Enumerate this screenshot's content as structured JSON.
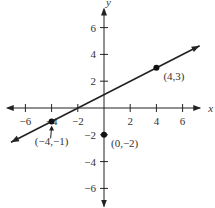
{
  "chart_data": {
    "type": "line",
    "title": "",
    "xlabel": "x",
    "ylabel": "y",
    "xlim": [
      -7.5,
      7.5
    ],
    "ylim": [
      -7.5,
      7.5
    ],
    "x_ticks": [
      -6,
      -4,
      -2,
      2,
      4,
      6
    ],
    "y_ticks": [
      -6,
      -4,
      -2,
      2,
      4,
      6
    ],
    "x_tick_labels": [
      "−6",
      "−4",
      "−2",
      "2",
      "4",
      "6"
    ],
    "y_tick_labels": [
      "−6",
      "−4",
      "−2",
      "2",
      "4",
      "6"
    ],
    "line": {
      "slope": 0.5,
      "intercept": 1,
      "x_range": [
        -7.5,
        7.5
      ]
    },
    "points": [
      {
        "x": 4,
        "y": 3,
        "label": "(4,3)"
      },
      {
        "x": -4,
        "y": -1,
        "label": "(−4,−1)"
      },
      {
        "x": 0,
        "y": -2,
        "label": "(0,−2)"
      }
    ],
    "grid": false
  }
}
